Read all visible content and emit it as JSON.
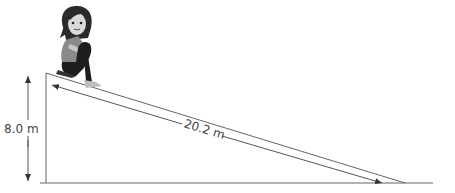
{
  "diagram": {
    "type": "inclined-plane",
    "height_label": "8.0 m",
    "slope_label": "20.2 m",
    "figure": "girl-sitting-on-top-of-slide",
    "colors": {
      "line": "#555555",
      "text": "#444444",
      "background": "#ffffff"
    }
  }
}
